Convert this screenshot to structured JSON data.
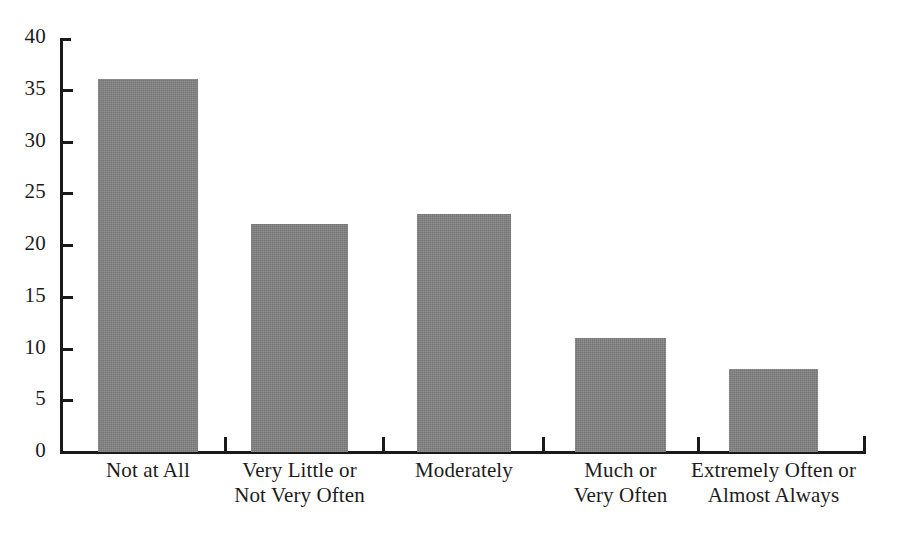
{
  "chart_data": {
    "type": "bar",
    "title": "",
    "subtitle": "",
    "xlabel": "",
    "ylabel": "",
    "categories": [
      "Not at All",
      "Very Little or\nNot Very Often",
      "Moderately",
      "Much or\nVery Often",
      "Extremely Often or\nAlmost Always"
    ],
    "values": [
      36,
      22,
      23,
      11,
      8
    ],
    "ylim": [
      0,
      40
    ],
    "ytick_labels": [
      "0",
      "5",
      "10",
      "15",
      "20",
      "25",
      "30",
      "35",
      "40"
    ],
    "ytick_values": [
      0,
      5,
      10,
      15,
      20,
      25,
      30,
      35,
      40
    ],
    "grid": false,
    "legend": null,
    "bar_color": "#828282",
    "axis_color": "#1a1a1a",
    "text_color": "#1c1c1c",
    "background_color": "#ffffff"
  }
}
